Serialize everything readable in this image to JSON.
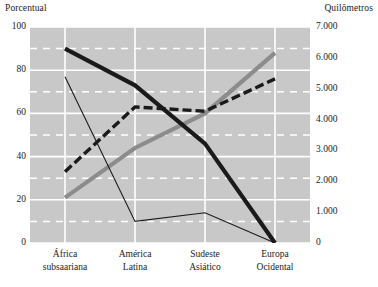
{
  "axis_titles": {
    "left": "Porcentual",
    "right": "Quilômetros"
  },
  "chart_data": {
    "type": "line",
    "title": "",
    "subtitle": "",
    "xlabel": "",
    "ylabel": "Porcentual",
    "y2label": "Quilômetros",
    "categories": [
      "África subsaariana",
      "América Latina",
      "Sudeste Asiático",
      "Europa Ocidental"
    ],
    "category_lines": [
      [
        "África",
        "subsaariana"
      ],
      [
        "América",
        "Latina"
      ],
      [
        "Sudeste",
        "Asiático"
      ],
      [
        "Europa",
        "Ocidental"
      ]
    ],
    "ylim": [
      0,
      100
    ],
    "yticks": [
      0,
      20,
      40,
      60,
      80,
      100
    ],
    "ytick_labels": [
      "0",
      "20",
      "40",
      "60",
      "80",
      "100"
    ],
    "y2lim": [
      0,
      7000
    ],
    "y2ticks": [
      0,
      1000,
      2000,
      3000,
      4000,
      5000,
      6000,
      7000
    ],
    "y2tick_labels": [
      "0",
      "1.000",
      "2.000",
      "3.000",
      "4.000",
      "5.000",
      "6.000",
      "7.000"
    ],
    "grid": true,
    "grid_major_color": "#ffffff",
    "grid_minor_color": "#ffffff",
    "grid_minor_style": "dashed",
    "plot_background": "#c8c8c8",
    "legend": "none",
    "legend_position": "none",
    "series": [
      {
        "name": "serie-preta-grossa",
        "axis": "left",
        "style": "solid",
        "color": "#1a1a1a",
        "width": 4.2,
        "values": [
          90,
          73,
          46,
          0
        ]
      },
      {
        "name": "serie-preta-pontilhada",
        "axis": "left",
        "style": "dashed",
        "color": "#1a1a1a",
        "width": 3.4,
        "values": [
          33,
          63,
          61,
          76
        ]
      },
      {
        "name": "serie-cinza-grossa",
        "axis": "left",
        "style": "solid",
        "color": "#8c8c8c",
        "width": 4.2,
        "values": [
          21,
          44,
          60,
          88
        ]
      },
      {
        "name": "serie-preta-fina",
        "axis": "left",
        "style": "solid",
        "color": "#1a1a1a",
        "width": 1.1,
        "values": [
          77,
          10,
          14,
          0
        ]
      }
    ]
  }
}
